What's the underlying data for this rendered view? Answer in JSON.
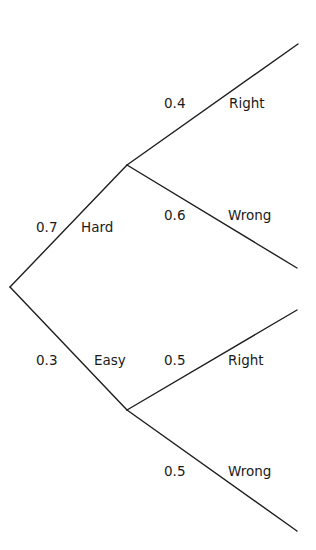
{
  "diagram": {
    "type": "probability-tree",
    "root": {
      "branches": [
        {
          "outcome": "Hard",
          "probability": "0.7",
          "branches": [
            {
              "outcome": "Right",
              "probability": "0.4"
            },
            {
              "outcome": "Wrong",
              "probability": "0.6"
            }
          ]
        },
        {
          "outcome": "Easy",
          "probability": "0.3",
          "branches": [
            {
              "outcome": "Right",
              "probability": "0.5"
            },
            {
              "outcome": "Wrong",
              "probability": "0.5"
            }
          ]
        }
      ]
    }
  },
  "colors": {
    "line": "#1e1e1e",
    "text": "#1a1a1a",
    "background": "#ffffff"
  }
}
